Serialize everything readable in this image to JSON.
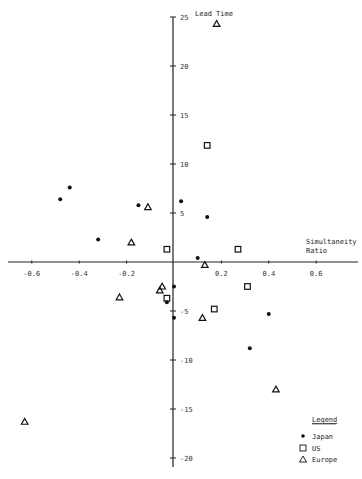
{
  "chart_data": {
    "type": "scatter",
    "title": "",
    "xlabel": "Simultaneity Ratio",
    "ylabel": "Lead Time",
    "xlim": [
      -0.7,
      0.78
    ],
    "ylim": [
      -21,
      25.5
    ],
    "x_ticks": [
      -0.6,
      -0.4,
      -0.2,
      0.2,
      0.4,
      0.6
    ],
    "x_tick_labels": [
      "-0.6",
      "-0.4",
      "-0.2",
      "0.2",
      "0.4",
      "0.6"
    ],
    "y_ticks": [
      25,
      20,
      15,
      10,
      5,
      -5,
      -10,
      -15,
      -20
    ],
    "y_tick_labels": [
      "25",
      "20",
      "15",
      "10",
      "5",
      "-5",
      "-10",
      "-15",
      "-20"
    ],
    "grid": false,
    "legend_position": "bottom-right",
    "legend_title": "Legend",
    "series": [
      {
        "name": "Japan",
        "marker": "filled-circle",
        "points": [
          {
            "x": -0.48,
            "y": 6.4
          },
          {
            "x": -0.44,
            "y": 7.6
          },
          {
            "x": -0.32,
            "y": 2.3
          },
          {
            "x": -0.15,
            "y": 5.8
          },
          {
            "x": 0.03,
            "y": 6.2
          },
          {
            "x": 0.14,
            "y": 4.6
          },
          {
            "x": 0.1,
            "y": 0.4
          },
          {
            "x": 0.0,
            "y": -2.5
          },
          {
            "x": -0.03,
            "y": -4.1
          },
          {
            "x": 0.0,
            "y": -5.7
          },
          {
            "x": 0.4,
            "y": -5.3
          },
          {
            "x": 0.32,
            "y": -8.8
          }
        ]
      },
      {
        "name": "US",
        "marker": "open-square",
        "points": [
          {
            "x": 0.14,
            "y": 11.9
          },
          {
            "x": -0.03,
            "y": 1.3
          },
          {
            "x": 0.27,
            "y": 1.3
          },
          {
            "x": 0.31,
            "y": -2.5
          },
          {
            "x": -0.03,
            "y": -3.7
          },
          {
            "x": 0.17,
            "y": -4.8
          }
        ]
      },
      {
        "name": "Europe",
        "marker": "open-triangle",
        "points": [
          {
            "x": 0.18,
            "y": 24.3
          },
          {
            "x": -0.11,
            "y": 5.6
          },
          {
            "x": -0.18,
            "y": 2.0
          },
          {
            "x": 0.13,
            "y": -0.3
          },
          {
            "x": -0.05,
            "y": -2.5
          },
          {
            "x": -0.06,
            "y": -2.9
          },
          {
            "x": -0.23,
            "y": -3.6
          },
          {
            "x": 0.12,
            "y": -5.7
          },
          {
            "x": 0.43,
            "y": -13.0
          },
          {
            "x": -0.63,
            "y": -16.3
          }
        ]
      }
    ]
  },
  "labels": {
    "x_axis_title_line1": "Simultaneity",
    "x_axis_title_line2": "Ratio",
    "y_axis_title": "Lead Time",
    "legend_title": "Legend",
    "legend_japan": "Japan",
    "legend_us": "US",
    "legend_europe": "Europe"
  }
}
